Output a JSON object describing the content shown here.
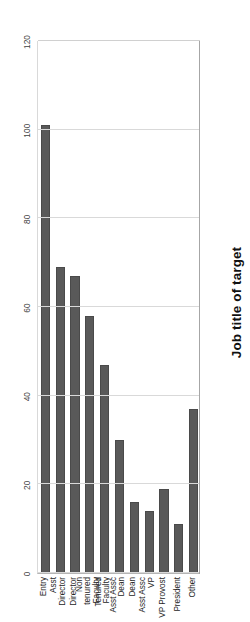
{
  "chart_data": {
    "type": "bar",
    "orientation": "horizontal",
    "title": "Job title of target",
    "xlabel": "",
    "ylabel": "",
    "xlim": [
      0,
      120
    ],
    "grid": true,
    "legend": false,
    "bar_color": "#595959",
    "ticks": [
      "0",
      "20",
      "40",
      "60",
      "80",
      "100",
      "120"
    ],
    "tick_values": [
      0,
      20,
      40,
      60,
      80,
      100,
      120
    ],
    "categories": [
      "Entry",
      "Asst Director",
      "Director",
      "Non tenured Faculty",
      "Tenured Faculty",
      "Asst Assc Dean",
      "Dean",
      "Asst Assc VP",
      "VP Provost",
      "President",
      "Other"
    ],
    "category_lines": [
      [
        "Entry"
      ],
      [
        "Asst",
        "Director"
      ],
      [
        "Director"
      ],
      [
        "Non",
        "tenured",
        "Faculty"
      ],
      [
        "Tenured",
        "Faculty"
      ],
      [
        "Asst Assc",
        "Dean"
      ],
      [
        "Dean"
      ],
      [
        "Asst Assc",
        "VP"
      ],
      [
        "VP Provost"
      ],
      [
        "President"
      ],
      [
        "Other"
      ]
    ],
    "values": [
      101,
      69,
      67,
      58,
      47,
      30,
      16,
      14,
      19,
      11,
      37
    ]
  }
}
